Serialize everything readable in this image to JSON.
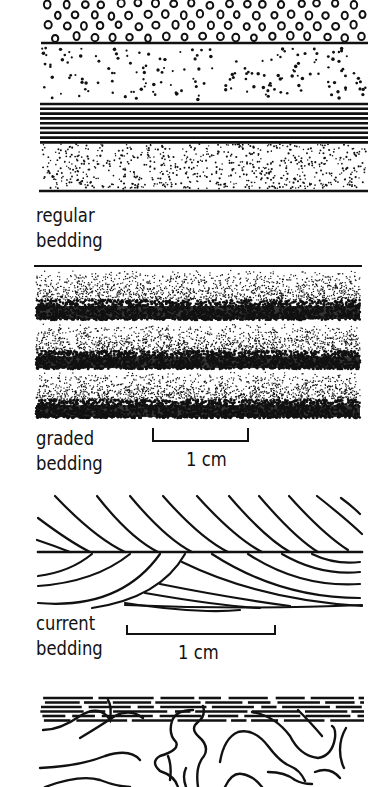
{
  "figure": {
    "panels": [
      {
        "id": "regular",
        "label_line1": "regular",
        "label_line2": "bedding"
      },
      {
        "id": "graded",
        "label_line1": "graded",
        "label_line2": "bedding",
        "scale_label": "1 cm"
      },
      {
        "id": "current",
        "label_line1": "current",
        "label_line2": "bedding",
        "scale_label": "1 cm"
      },
      {
        "id": "convolute",
        "label_line1": "",
        "label_line2": ""
      }
    ]
  },
  "colors": {
    "ink": "#111111",
    "paper": "#ffffff"
  }
}
